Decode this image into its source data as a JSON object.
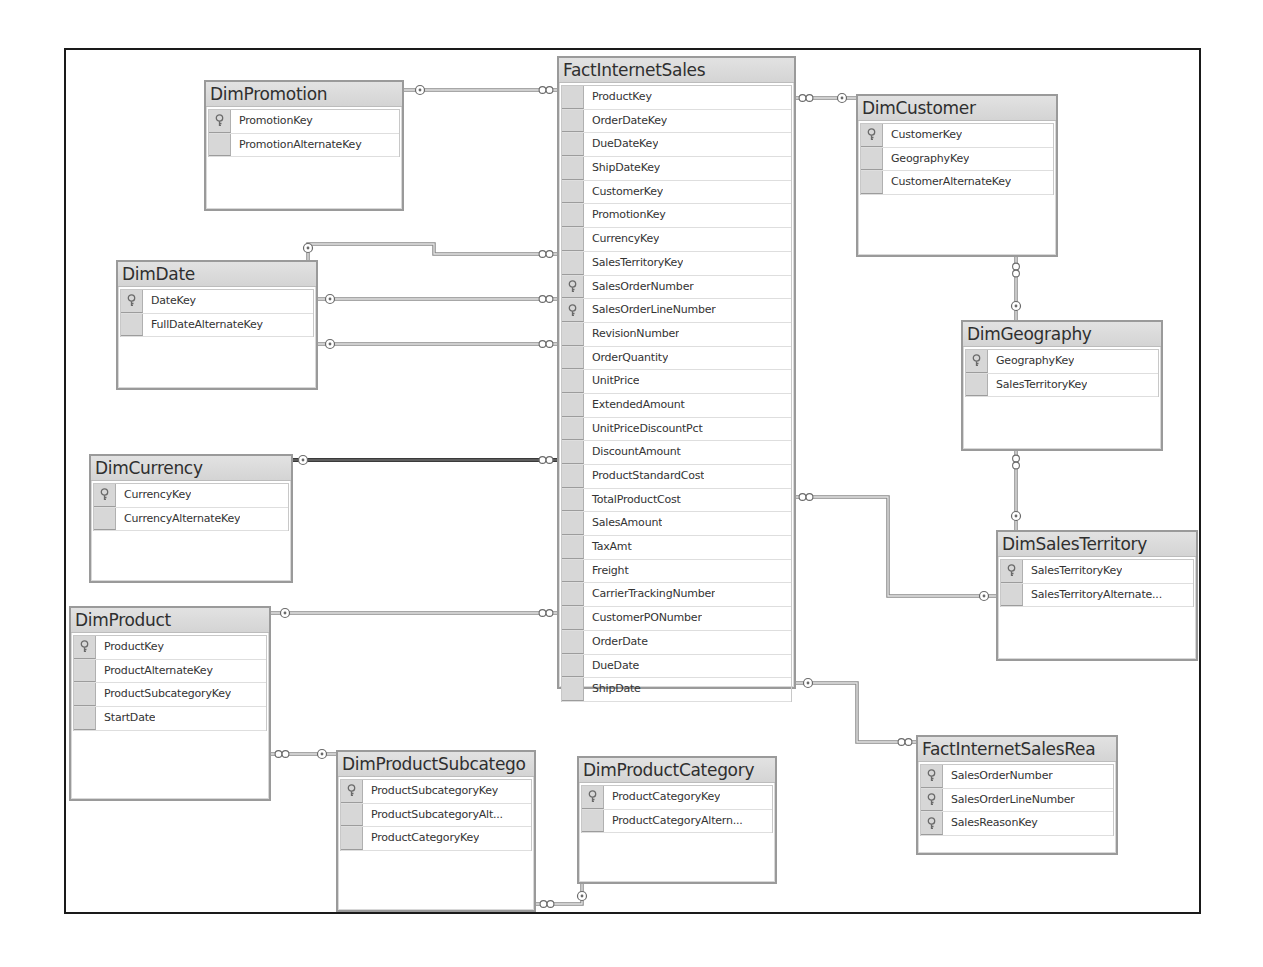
{
  "diagram": {
    "frame": {
      "left": 64,
      "top": 48,
      "right": 1201,
      "bottom": 914
    },
    "colors": {
      "line": "#8a8a8a",
      "line_dark": "#3a3a3a",
      "border": "#9a9a9a",
      "header": "#d9d9d9",
      "key_cell": "#d7d7d7"
    },
    "tables": [
      {
        "id": "FactInternetSales",
        "title": "FactInternetSales",
        "x": 557,
        "y": 56,
        "w": 239,
        "h": 633,
        "columns": [
          {
            "name": "ProductKey",
            "pk": false
          },
          {
            "name": "OrderDateKey",
            "pk": false
          },
          {
            "name": "DueDateKey",
            "pk": false
          },
          {
            "name": "ShipDateKey",
            "pk": false
          },
          {
            "name": "CustomerKey",
            "pk": false
          },
          {
            "name": "PromotionKey",
            "pk": false
          },
          {
            "name": "CurrencyKey",
            "pk": false
          },
          {
            "name": "SalesTerritoryKey",
            "pk": false
          },
          {
            "name": "SalesOrderNumber",
            "pk": true
          },
          {
            "name": "SalesOrderLineNumber",
            "pk": true
          },
          {
            "name": "RevisionNumber",
            "pk": false
          },
          {
            "name": "OrderQuantity",
            "pk": false
          },
          {
            "name": "UnitPrice",
            "pk": false
          },
          {
            "name": "ExtendedAmount",
            "pk": false
          },
          {
            "name": "UnitPriceDiscountPct",
            "pk": false
          },
          {
            "name": "DiscountAmount",
            "pk": false
          },
          {
            "name": "ProductStandardCost",
            "pk": false
          },
          {
            "name": "TotalProductCost",
            "pk": false
          },
          {
            "name": "SalesAmount",
            "pk": false
          },
          {
            "name": "TaxAmt",
            "pk": false
          },
          {
            "name": "Freight",
            "pk": false
          },
          {
            "name": "CarrierTrackingNumber",
            "pk": false
          },
          {
            "name": "CustomerPONumber",
            "pk": false
          },
          {
            "name": "OrderDate",
            "pk": false
          },
          {
            "name": "DueDate",
            "pk": false
          },
          {
            "name": "ShipDate",
            "pk": false
          }
        ]
      },
      {
        "id": "DimPromotion",
        "title": "DimPromotion",
        "x": 204,
        "y": 80,
        "w": 200,
        "h": 131,
        "columns": [
          {
            "name": "PromotionKey",
            "pk": true
          },
          {
            "name": "PromotionAlternateKey",
            "pk": false
          }
        ]
      },
      {
        "id": "DimDate",
        "title": "DimDate",
        "x": 116,
        "y": 260,
        "w": 202,
        "h": 130,
        "columns": [
          {
            "name": "DateKey",
            "pk": true
          },
          {
            "name": "FullDateAlternateKey",
            "pk": false
          }
        ]
      },
      {
        "id": "DimCurrency",
        "title": "DimCurrency",
        "x": 89,
        "y": 454,
        "w": 204,
        "h": 129,
        "columns": [
          {
            "name": "CurrencyKey",
            "pk": true
          },
          {
            "name": "CurrencyAlternateKey",
            "pk": false
          }
        ]
      },
      {
        "id": "DimProduct",
        "title": "DimProduct",
        "x": 69,
        "y": 606,
        "w": 202,
        "h": 195,
        "columns": [
          {
            "name": "ProductKey",
            "pk": true
          },
          {
            "name": "ProductAlternateKey",
            "pk": false
          },
          {
            "name": "ProductSubcategoryKey",
            "pk": false
          },
          {
            "name": "StartDate",
            "pk": false
          }
        ]
      },
      {
        "id": "DimProductSubcategory",
        "title": "DimProductSubcatego",
        "x": 336,
        "y": 750,
        "w": 200,
        "h": 162,
        "columns": [
          {
            "name": "ProductSubcategoryKey",
            "pk": true
          },
          {
            "name": "ProductSubcategoryAlt...",
            "pk": false
          },
          {
            "name": "ProductCategoryKey",
            "pk": false
          }
        ]
      },
      {
        "id": "DimProductCategory",
        "title": "DimProductCategory",
        "x": 577,
        "y": 756,
        "w": 200,
        "h": 128,
        "columns": [
          {
            "name": "ProductCategoryKey",
            "pk": true
          },
          {
            "name": "ProductCategoryAltern...",
            "pk": false
          }
        ]
      },
      {
        "id": "DimCustomer",
        "title": "DimCustomer",
        "x": 856,
        "y": 94,
        "w": 202,
        "h": 163,
        "columns": [
          {
            "name": "CustomerKey",
            "pk": true
          },
          {
            "name": "GeographyKey",
            "pk": false
          },
          {
            "name": "CustomerAlternateKey",
            "pk": false
          }
        ]
      },
      {
        "id": "DimGeography",
        "title": "DimGeography",
        "x": 961,
        "y": 320,
        "w": 202,
        "h": 131,
        "columns": [
          {
            "name": "GeographyKey",
            "pk": true
          },
          {
            "name": "SalesTerritoryKey",
            "pk": false
          }
        ]
      },
      {
        "id": "DimSalesTerritory",
        "title": "DimSalesTerritory",
        "x": 996,
        "y": 530,
        "w": 202,
        "h": 131,
        "columns": [
          {
            "name": "SalesTerritoryKey",
            "pk": true
          },
          {
            "name": "SalesTerritoryAlternate...",
            "pk": false
          }
        ]
      },
      {
        "id": "FactInternetSalesReason",
        "title": "FactInternetSalesRea",
        "x": 916,
        "y": 735,
        "w": 202,
        "h": 120,
        "columns": [
          {
            "name": "SalesOrderNumber",
            "pk": true
          },
          {
            "name": "SalesOrderLineNumber",
            "pk": true
          },
          {
            "name": "SalesReasonKey",
            "pk": true
          }
        ]
      }
    ],
    "relationships": [
      {
        "from": "DimPromotion",
        "to": "FactInternetSales",
        "points": [
          [
            404,
            90
          ],
          [
            557,
            90
          ]
        ],
        "one_end": [
          420,
          90
        ],
        "many_end": [
          546,
          90
        ]
      },
      {
        "from": "DimDate",
        "to": "FactInternetSales",
        "points": [
          [
            308,
            260
          ],
          [
            308,
            244
          ],
          [
            434,
            244
          ],
          [
            434,
            254
          ],
          [
            557,
            254
          ]
        ],
        "one_end": [
          308,
          248
        ],
        "many_end": [
          546,
          254
        ],
        "label": "ShipDateKey"
      },
      {
        "from": "DimDate",
        "to": "FactInternetSales",
        "points": [
          [
            318,
            299
          ],
          [
            557,
            299
          ]
        ],
        "one_end": [
          330,
          299
        ],
        "many_end": [
          546,
          299
        ],
        "label": "OrderDateKey"
      },
      {
        "from": "DimDate",
        "to": "FactInternetSales",
        "points": [
          [
            318,
            344
          ],
          [
            557,
            344
          ]
        ],
        "one_end": [
          330,
          344
        ],
        "many_end": [
          546,
          344
        ],
        "label": "DueDateKey"
      },
      {
        "from": "DimCurrency",
        "to": "FactInternetSales",
        "points": [
          [
            293,
            460
          ],
          [
            557,
            460
          ]
        ],
        "one_end": [
          303,
          460
        ],
        "many_end": [
          546,
          460
        ],
        "dark": true
      },
      {
        "from": "DimProduct",
        "to": "FactInternetSales",
        "points": [
          [
            271,
            613
          ],
          [
            557,
            613
          ]
        ],
        "one_end": [
          285,
          613
        ],
        "many_end": [
          546,
          613
        ]
      },
      {
        "from": "DimCustomer",
        "to": "FactInternetSales",
        "points": [
          [
            796,
            98
          ],
          [
            856,
            98
          ]
        ],
        "one_end": [
          842,
          98
        ],
        "many_end": [
          806,
          98
        ]
      },
      {
        "from": "DimSalesTerritory",
        "to": "FactInternetSales",
        "points": [
          [
            796,
            497
          ],
          [
            888,
            497
          ],
          [
            888,
            596
          ],
          [
            996,
            596
          ]
        ],
        "one_end": [
          984,
          596
        ],
        "many_end": [
          806,
          497
        ]
      },
      {
        "from": "FactInternetSales",
        "to": "FactInternetSalesReason",
        "points": [
          [
            796,
            683
          ],
          [
            857,
            683
          ],
          [
            857,
            742
          ],
          [
            916,
            742
          ]
        ],
        "one_end": [
          808,
          683
        ],
        "many_end": [
          905,
          742
        ]
      },
      {
        "from": "DimGeography",
        "to": "DimCustomer",
        "points": [
          [
            1016,
            257
          ],
          [
            1016,
            320
          ]
        ],
        "one_end": [
          1016,
          306
        ],
        "many_end": [
          1016,
          270
        ],
        "vertical": true
      },
      {
        "from": "DimSalesTerritory",
        "to": "DimGeography",
        "points": [
          [
            1016,
            451
          ],
          [
            1016,
            530
          ]
        ],
        "one_end": [
          1016,
          516
        ],
        "many_end": [
          1016,
          462
        ],
        "vertical": true
      },
      {
        "from": "DimProductSubcategory",
        "to": "DimProduct",
        "points": [
          [
            271,
            754
          ],
          [
            336,
            754
          ]
        ],
        "one_end": [
          322,
          754
        ],
        "many_end": [
          282,
          754
        ]
      },
      {
        "from": "DimProductCategory",
        "to": "DimProductSubcategory",
        "points": [
          [
            536,
            904
          ],
          [
            582,
            904
          ],
          [
            582,
            884
          ]
        ],
        "one_end": [
          582,
          896
        ],
        "many_end": [
          547,
          904
        ]
      }
    ]
  }
}
